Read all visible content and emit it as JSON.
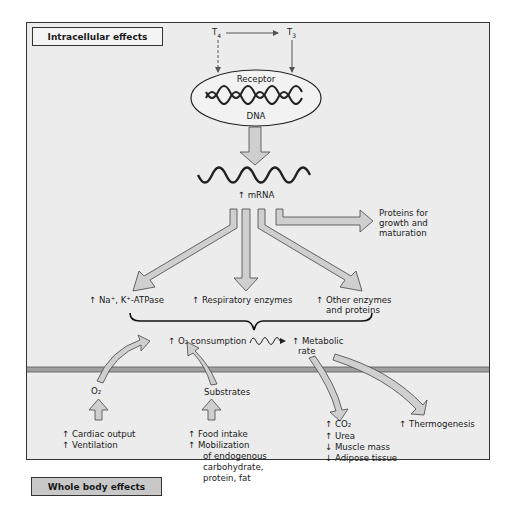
{
  "diagram": {
    "sections": {
      "intracellular": "Intracellular effects",
      "whole_body": "Whole body effects"
    },
    "hormones": {
      "t4": "T4",
      "t3": "T3",
      "t4_sub": "4",
      "t3_sub": "3"
    },
    "receptor": {
      "top": "Receptor",
      "bottom": "DNA"
    },
    "mrna": "↑ mRNA",
    "proteins": [
      "Proteins for",
      "growth and",
      "maturation"
    ],
    "outputs": {
      "atpase": "↑ Na⁺, K⁺-ATPase",
      "respiratory": "↑ Respiratory enzymes",
      "other": [
        "↑ Other enzymes",
        "and proteins"
      ]
    },
    "o2_consumption": "↑ O₂ consumption",
    "metabolic_rate": [
      "↑ Metabolic",
      "rate"
    ],
    "o2": "O₂",
    "substrates": "Substrates",
    "cardiac": [
      "↑ Cardiac output",
      "↑ Ventilation"
    ],
    "food": [
      "↑ Food intake",
      "↑ Mobilization",
      "of endogenous",
      "carbohydrate,",
      "protein, fat"
    ],
    "co2": [
      "↑ CO₂",
      "↑ Urea",
      "↓ Muscle mass",
      "↓ Adipose tissue"
    ],
    "thermogenesis": "↑ Thermogenesis",
    "colors": {
      "background": "#ececec",
      "arrow_fill": "#cfcfcf",
      "outline": "#333333",
      "membrane": "#9a9a9a",
      "whole_body_box": "#c8c8c8"
    }
  }
}
